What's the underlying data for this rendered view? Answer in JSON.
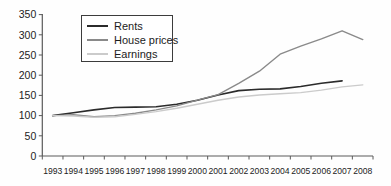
{
  "legend": {
    "items": [
      {
        "label": "Rents",
        "color": "#2b2b2b"
      },
      {
        "label": "House prices",
        "color": "#8a8a8a"
      },
      {
        "label": "Earnings",
        "color": "#cbcbcb"
      }
    ]
  },
  "axes": {
    "y_tick_labels": [
      "0",
      "50",
      "100",
      "150",
      "200",
      "250",
      "300",
      "350"
    ],
    "x_tick_labels": [
      "1993",
      "1994",
      "1995",
      "1996",
      "1997",
      "1998",
      "1999",
      "2000",
      "2001",
      "2002",
      "2003",
      "2004",
      "2005",
      "2006",
      "2007",
      "2008"
    ]
  },
  "colors": {
    "axis": "#5a5a5a",
    "tick_text": "#222222"
  },
  "chart_data": {
    "type": "line",
    "title": "",
    "xlabel": "",
    "ylabel": "",
    "categories": [
      "1993",
      "1994",
      "1995",
      "1996",
      "1997",
      "1998",
      "1999",
      "2000",
      "2001",
      "2002",
      "2003",
      "2004",
      "2005",
      "2006",
      "2007",
      "2008"
    ],
    "series": [
      {
        "name": "Rents",
        "color": "#2b2b2b",
        "width": 1.6,
        "values": [
          100,
          107,
          114,
          120,
          121,
          122,
          128,
          138,
          151,
          162,
          165,
          166,
          172,
          180,
          186,
          null
        ]
      },
      {
        "name": "House prices",
        "color": "#8a8a8a",
        "width": 1.4,
        "values": [
          100,
          102,
          97,
          100,
          106,
          114,
          124,
          138,
          152,
          180,
          210,
          252,
          272,
          290,
          310,
          288
        ]
      },
      {
        "name": "Earnings",
        "color": "#cbcbcb",
        "width": 1.4,
        "values": [
          100,
          99,
          96,
          97,
          103,
          110,
          118,
          128,
          138,
          146,
          151,
          154,
          157,
          163,
          171,
          176
        ]
      }
    ],
    "ylim": [
      0,
      350
    ],
    "ytick_interval": 50,
    "grid": false,
    "legend_position": "top-left-inside"
  }
}
